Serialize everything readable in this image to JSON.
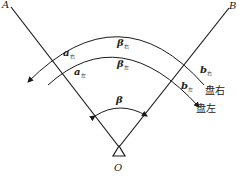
{
  "diagram": {
    "type": "horizontal-angle-measurement",
    "points": {
      "A": "A",
      "B": "B",
      "O": "O"
    },
    "labels": {
      "a_right": {
        "main": "a",
        "sub": "右"
      },
      "a_left": {
        "main": "a",
        "sub": "左"
      },
      "beta_right": {
        "main": "β",
        "sub": "右"
      },
      "beta_left": {
        "main": "β",
        "sub": "左"
      },
      "b_right": {
        "main": "b",
        "sub": "右"
      },
      "b_left": {
        "main": "b",
        "sub": "左"
      },
      "beta": "β"
    },
    "faces": {
      "right": "盘右",
      "left": "盘左"
    },
    "colors": {
      "stroke": "#1a1a1a",
      "background": "#ffffff"
    }
  }
}
